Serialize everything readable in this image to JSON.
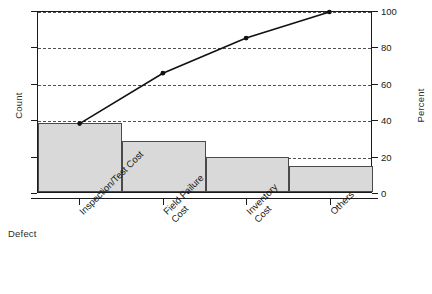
{
  "chart_data": {
    "type": "bar",
    "title": "",
    "subtitle": "",
    "xlabel": "Defect",
    "ylabel": "Count",
    "y2label": "Percent",
    "categories": [
      "Inspection/Test Cost",
      "Field Failure Cost",
      "Inventory Cost",
      "Others"
    ],
    "category_lines": [
      [
        "Inspection/Test Cost"
      ],
      [
        "Field Failure",
        "Cost"
      ],
      [
        "Inventory",
        "Cost"
      ],
      [
        "Others"
      ]
    ],
    "series": [
      {
        "name": "Count",
        "type": "bar",
        "values_percent": [
          38.0,
          28.0,
          19.5,
          14.5
        ]
      },
      {
        "name": "Cumulative Percent",
        "type": "line",
        "values": [
          38.0,
          66.0,
          85.5,
          100.0
        ]
      }
    ],
    "y2_ticks": [
      0,
      20,
      40,
      60,
      80,
      100
    ],
    "y2lim": [
      0,
      100
    ],
    "ylim": [
      0,
      100
    ],
    "grid": true,
    "grid_axis": "y",
    "legend": "none",
    "bar_fill": "#d9d9d9",
    "bar_stroke": "#4a4a4a",
    "line_color": "#111111",
    "frame_color": "#1a1a1a"
  },
  "axes": {
    "left_title": "Count",
    "right_title": "Percent",
    "bottom_title": "Defect",
    "right_tick_labels": [
      "0",
      "20",
      "40",
      "60",
      "80",
      "100"
    ]
  }
}
